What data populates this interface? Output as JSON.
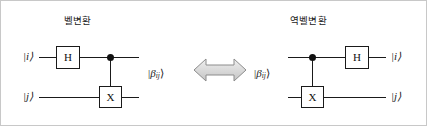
{
  "figure": {
    "background": "#ffffff",
    "border_color": "#c8c8c8",
    "line_color": "#1a1a1a",
    "arrow_fill": "#d9d9d9",
    "arrow_stroke": "#7f7f7f"
  },
  "panels": {
    "left": {
      "title": "벨변환",
      "inputs": [
        {
          "label": "|i⟩",
          "wire": "top"
        },
        {
          "label": "|j⟩",
          "wire": "bottom"
        }
      ],
      "gates": [
        {
          "name": "hadamard",
          "label": "H",
          "wire": "top",
          "order": 1
        },
        {
          "name": "control-dot",
          "label": "",
          "wire": "top",
          "order": 2
        },
        {
          "name": "pauli-x",
          "label": "X",
          "wire": "bottom",
          "order": 2
        }
      ],
      "output_state": {
        "symbol": "β",
        "subscript": "ij"
      }
    },
    "right": {
      "title": "역벨변환",
      "input_state": {
        "symbol": "β",
        "subscript": "ij"
      },
      "gates": [
        {
          "name": "control-dot",
          "label": "",
          "wire": "top",
          "order": 1
        },
        {
          "name": "pauli-x",
          "label": "X",
          "wire": "bottom",
          "order": 1
        },
        {
          "name": "hadamard",
          "label": "H",
          "wire": "top",
          "order": 2
        }
      ],
      "outputs": [
        {
          "label": "|i⟩",
          "wire": "top"
        },
        {
          "label": "|j⟩",
          "wire": "bottom"
        }
      ]
    }
  },
  "connector": {
    "icon": "double-headed-arrow-icon",
    "direction": "bidirectional"
  }
}
